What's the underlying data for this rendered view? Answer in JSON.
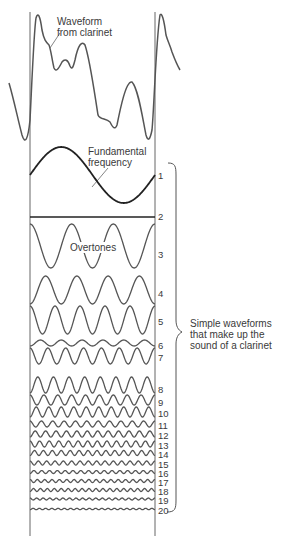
{
  "figure": {
    "top_cut_text": "",
    "labels": {
      "waveform": "Waveform\nfrom clarinet",
      "waveform_line1": "Waveform",
      "waveform_line2": "from clarinet",
      "fundamental_line1": "Fundamental",
      "fundamental_line2": "frequency",
      "overtones": "Overtones",
      "bracket_line1": "Simple waveforms",
      "bracket_line2": "that make up the",
      "bracket_line3": "sound of a clarinet"
    },
    "stroke_color": "#555555",
    "fundamental_color": "#222222",
    "frame": {
      "left_x": 30,
      "right_x": 155,
      "top_y": 12,
      "bottom_y": 536
    }
  },
  "harmonics": [
    {
      "n": "1",
      "y": 175,
      "amp": 28,
      "cycles": 1,
      "label_y": 171
    },
    {
      "n": "2",
      "y": 217,
      "amp": 0,
      "cycles": 2,
      "label_y": 212
    },
    {
      "n": "3",
      "y": 246,
      "amp": 22,
      "cycles": 3,
      "label_y": 250
    },
    {
      "n": "4",
      "y": 290,
      "amp": 14,
      "cycles": 4,
      "label_y": 289
    },
    {
      "n": "5",
      "y": 320,
      "amp": 14,
      "cycles": 5,
      "label_y": 317
    },
    {
      "n": "6",
      "y": 343,
      "amp": 3,
      "cycles": 6,
      "label_y": 341
    },
    {
      "n": "7",
      "y": 356,
      "amp": 8,
      "cycles": 7,
      "label_y": 353
    },
    {
      "n": "8",
      "y": 385,
      "amp": 8,
      "cycles": 8,
      "label_y": 385
    },
    {
      "n": "9",
      "y": 400,
      "amp": 5,
      "cycles": 9,
      "label_y": 398
    },
    {
      "n": "10",
      "y": 412,
      "amp": 5,
      "cycles": 10,
      "label_y": 409
    },
    {
      "n": "11",
      "y": 424,
      "amp": 3,
      "cycles": 11,
      "label_y": 421
    },
    {
      "n": "12",
      "y": 434,
      "amp": 3,
      "cycles": 12,
      "label_y": 431
    },
    {
      "n": "13",
      "y": 444,
      "amp": 3,
      "cycles": 13,
      "label_y": 441
    },
    {
      "n": "14",
      "y": 453,
      "amp": 2.5,
      "cycles": 14,
      "label_y": 450
    },
    {
      "n": "15",
      "y": 463,
      "amp": 2,
      "cycles": 15,
      "label_y": 460
    },
    {
      "n": "16",
      "y": 472,
      "amp": 1.5,
      "cycles": 16,
      "label_y": 469
    },
    {
      "n": "17",
      "y": 481,
      "amp": 1.5,
      "cycles": 17,
      "label_y": 478
    },
    {
      "n": "18",
      "y": 490,
      "amp": 1.5,
      "cycles": 18,
      "label_y": 487
    },
    {
      "n": "19",
      "y": 499,
      "amp": 1,
      "cycles": 19,
      "label_y": 496
    },
    {
      "n": "20",
      "y": 509,
      "amp": 0.6,
      "cycles": 20,
      "label_y": 506
    }
  ]
}
